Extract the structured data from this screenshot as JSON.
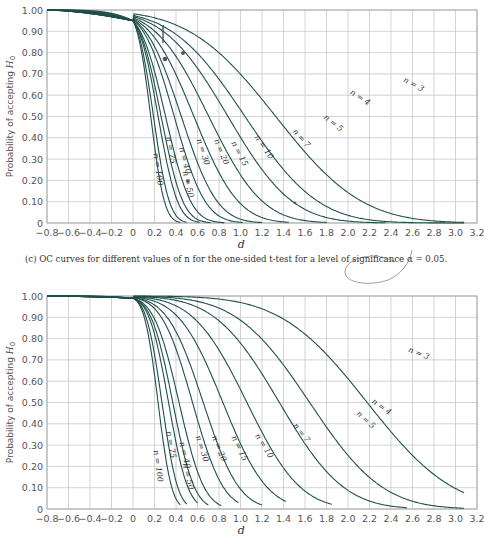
{
  "chart_data": [
    {
      "type": "line",
      "title": "",
      "caption_prefix": "(c)",
      "caption": "OC curves for different values of n for the one-sided t-test for a level of significance α = 0.05.",
      "xlabel": "d",
      "ylabel": "Probability of accepting H0",
      "xlim": [
        -0.8,
        3.2
      ],
      "ylim": [
        0,
        1.0
      ],
      "x_ticks": [
        "−0.8",
        "−0.6",
        "−0.4",
        "−0.2",
        "0",
        "0.2",
        "0.4",
        "0.6",
        "0.8",
        "1.0",
        "1.2",
        "1.4",
        "1.6",
        "1.8",
        "2.0",
        "2.2",
        "2.4",
        "2.6",
        "2.8",
        "3.0",
        "3.2"
      ],
      "y_ticks": [
        "0",
        "0.10",
        "0.20",
        "0.30",
        "0.40",
        "0.50",
        "0.60",
        "0.70",
        "0.80",
        "0.90",
        "1.00"
      ],
      "grid": true,
      "alpha": 0.05,
      "series": [
        {
          "name": "n = 3"
        },
        {
          "name": "n = 4"
        },
        {
          "name": "n = 5"
        },
        {
          "name": "n = 7"
        },
        {
          "name": "n = 10"
        },
        {
          "name": "n = 15"
        },
        {
          "name": "n = 20"
        },
        {
          "name": "n = 30"
        },
        {
          "name": "n = 40"
        },
        {
          "name": "n = 50"
        },
        {
          "name": "n = 75"
        },
        {
          "name": "n = 100"
        }
      ],
      "value_at_d0": 0.95,
      "value_at_d_minus_0.8": 1.0
    },
    {
      "type": "line",
      "title": "",
      "xlabel": "d",
      "ylabel": "Probability of accepting H0",
      "xlim": [
        -0.8,
        3.2
      ],
      "ylim": [
        0,
        1.0
      ],
      "x_ticks": [
        "−0.8",
        "−0.6",
        "−0.4",
        "−0.2",
        "0",
        "0.2",
        "0.4",
        "0.6",
        "0.8",
        "1.0",
        "1.2",
        "1.4",
        "1.6",
        "1.8",
        "2.0",
        "2.2",
        "2.4",
        "2.6",
        "2.8",
        "3.0",
        "3.2"
      ],
      "y_ticks": [
        "0",
        "0.10",
        "0.20",
        "0.30",
        "0.40",
        "0.50",
        "0.60",
        "0.70",
        "0.80",
        "0.90",
        "1.00"
      ],
      "grid": true,
      "alpha": 0.01,
      "series": [
        {
          "name": "n = 3"
        },
        {
          "name": "n = 4"
        },
        {
          "name": "n = 5"
        },
        {
          "name": "n = 7"
        },
        {
          "name": "n = 10"
        },
        {
          "name": "n = 15"
        },
        {
          "name": "n = 20"
        },
        {
          "name": "n = 30"
        },
        {
          "name": "n = 40"
        },
        {
          "name": "n = 50"
        },
        {
          "name": "n = 75"
        },
        {
          "name": "n = 100"
        }
      ],
      "value_at_d0": 0.99,
      "value_at_d_minus_0.8": 1.0
    }
  ],
  "figure": {
    "line_color": "#1f4f4a",
    "grid_color": "#c8c8c8",
    "axis_color": "#999999"
  }
}
